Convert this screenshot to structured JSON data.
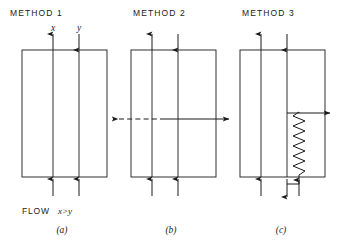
{
  "figure": {
    "caption_style": "italic-parenthetical",
    "panels": [
      {
        "id": "a",
        "title": "METHOD 1",
        "caption": "(a)",
        "labels": {
          "left_channel": "x",
          "right_channel": "y"
        },
        "flow_note_prefix": "FLOW",
        "flow_note_relation": "x>y",
        "top_arrows": [
          {
            "name": "inlet-left",
            "direction": "up"
          },
          {
            "name": "inlet-right",
            "direction": "down"
          }
        ],
        "bottom_arrows": [
          {
            "name": "outlet-left",
            "direction": "up"
          },
          {
            "name": "outlet-right",
            "direction": "up"
          }
        ],
        "has_side_arrows": false,
        "has_zigzag": false
      },
      {
        "id": "b",
        "title": "METHOD 2",
        "caption": "(b)",
        "labels": {
          "left_channel": "",
          "right_channel": ""
        },
        "flow_note_prefix": "",
        "flow_note_relation": "",
        "top_arrows": [
          {
            "name": "inlet-left",
            "direction": "up"
          },
          {
            "name": "inlet-right",
            "direction": "down"
          }
        ],
        "bottom_arrows": [
          {
            "name": "outlet-left",
            "direction": "up"
          },
          {
            "name": "outlet-right",
            "direction": "up"
          }
        ],
        "has_side_arrows": true,
        "side_arrows": [
          {
            "name": "cross-flow-left",
            "direction": "left",
            "style": "dashed"
          },
          {
            "name": "cross-flow-right",
            "direction": "right",
            "style": "solid"
          }
        ],
        "has_zigzag": false
      },
      {
        "id": "c",
        "title": "METHOD 3",
        "caption": "(c)",
        "labels": {
          "left_channel": "",
          "right_channel": ""
        },
        "flow_note_prefix": "",
        "flow_note_relation": "",
        "top_arrows": [
          {
            "name": "inlet-left",
            "direction": "up"
          },
          {
            "name": "inlet-right",
            "direction": "down"
          }
        ],
        "bottom_arrows": [
          {
            "name": "outlet-left",
            "direction": "up"
          },
          {
            "name": "outlet-right",
            "direction": "down"
          }
        ],
        "has_side_arrows": true,
        "side_arrows": [
          {
            "name": "zigzag-outlet",
            "direction": "right",
            "style": "solid"
          }
        ],
        "has_zigzag": true,
        "zigzag": {
          "name": "restrictor-coil",
          "peaks": 11
        }
      }
    ],
    "colors": {
      "ink": "#1a1a1a",
      "paper": "#ffffff"
    }
  }
}
